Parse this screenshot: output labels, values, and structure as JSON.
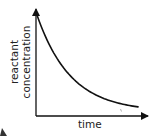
{
  "chart_data": {
    "type": "line",
    "title": "",
    "xlabel": "time",
    "ylabel": "reactant concentration",
    "ylabel_lines": [
      "reactant",
      "concentration"
    ],
    "ticks": {
      "x": [],
      "y": []
    },
    "grid": false,
    "legend": null,
    "series": [
      {
        "name": "reactant concentration",
        "shape": "exponential-decay",
        "x": [
          0,
          0.1,
          0.2,
          0.3,
          0.4,
          0.5,
          0.6,
          0.7,
          0.8,
          0.9,
          1.0
        ],
        "values": [
          1.0,
          0.72,
          0.53,
          0.4,
          0.3,
          0.23,
          0.18,
          0.15,
          0.12,
          0.1,
          0.09
        ]
      }
    ]
  },
  "colors": {
    "axis": "#111111",
    "curve": "#111111",
    "text": "#222222",
    "background": "#ffffff"
  }
}
